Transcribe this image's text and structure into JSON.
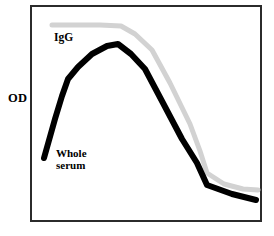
{
  "figure": {
    "width": 274,
    "height": 236,
    "background_color": "#ffffff",
    "frame_color": "#2b2b2b"
  },
  "axes": {
    "y_label": "OD",
    "x_label": "",
    "ticks_visible": false,
    "grid": false
  },
  "labels": {
    "igg": "IgG",
    "whole_serum": "Whole\nserum"
  },
  "chart_data": {
    "type": "line",
    "title": "",
    "xlabel": "",
    "ylabel": "OD",
    "grid": false,
    "legend": "inline-annotations",
    "xlim": [
      0,
      100
    ],
    "ylim": [
      0,
      100
    ],
    "series": [
      {
        "name": "IgG",
        "color": "#d2d2d2",
        "line_width": 5,
        "x": [
          10,
          20,
          30,
          39,
          45,
          52,
          60,
          68,
          72,
          75,
          82,
          90,
          98
        ],
        "y": [
          91,
          91,
          91,
          91,
          87,
          79,
          64,
          45,
          33,
          23,
          18,
          15,
          14
        ],
        "points_px": [
          [
            52,
            25
          ],
          [
            75,
            25
          ],
          [
            100,
            25
          ],
          [
            121,
            26
          ],
          [
            135,
            34
          ],
          [
            152,
            50
          ],
          [
            170,
            83
          ],
          [
            190,
            124
          ],
          [
            200,
            151
          ],
          [
            207,
            173
          ],
          [
            224,
            184
          ],
          [
            243,
            189
          ],
          [
            258,
            190
          ]
        ]
      },
      {
        "name": "Whole serum",
        "color": "#000000",
        "line_width": 6,
        "x": [
          6,
          12,
          16,
          21,
          27,
          34,
          40,
          45,
          52,
          60,
          68,
          75,
          80,
          85,
          92,
          97
        ],
        "y": [
          29,
          46,
          57,
          67,
          75,
          81,
          83,
          80,
          71,
          58,
          43,
          28,
          18,
          16,
          12,
          10
        ],
        "points_px": [
          [
            44,
            158
          ],
          [
            55,
            119
          ],
          [
            62,
            96
          ],
          [
            68,
            79
          ],
          [
            78,
            67
          ],
          [
            92,
            54
          ],
          [
            107,
            46
          ],
          [
            118,
            44
          ],
          [
            131,
            54
          ],
          [
            145,
            69
          ],
          [
            163,
            103
          ],
          [
            182,
            139
          ],
          [
            197,
            163
          ],
          [
            207,
            185
          ],
          [
            232,
            194
          ],
          [
            256,
            200
          ]
        ]
      }
    ]
  }
}
